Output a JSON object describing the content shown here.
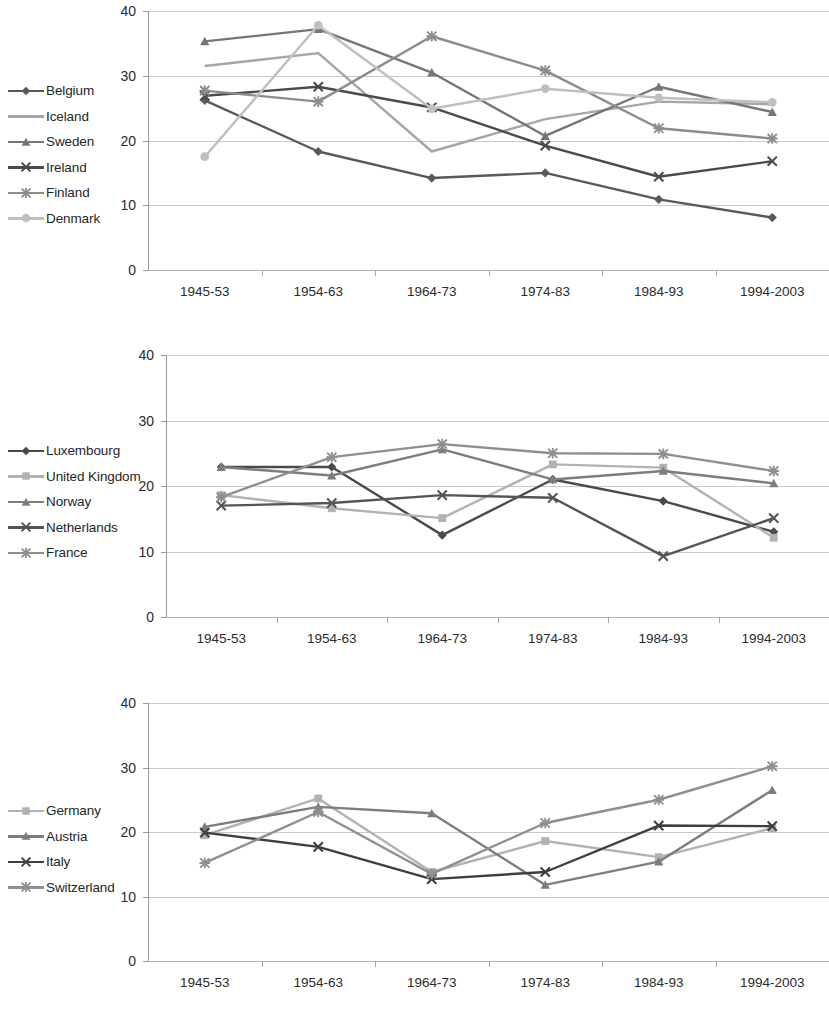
{
  "figure": {
    "categories": [
      "1945-53",
      "1954-63",
      "1964-73",
      "1974-83",
      "1984-93",
      "1994-2003"
    ],
    "y_ticks": [
      "0",
      "10",
      "20",
      "30",
      "40"
    ],
    "ylim": [
      0,
      40
    ]
  },
  "charts": [
    {
      "id": "chart-1",
      "legend_title": "",
      "series": [
        {
          "name": "Belgium",
          "marker": "diamond",
          "color": "#595959",
          "values": [
            26.2,
            18.3,
            14.2,
            15.0,
            10.9,
            8.1
          ]
        },
        {
          "name": "Iceland",
          "marker": "none",
          "color": "#a6a6a6",
          "values": [
            31.5,
            33.5,
            18.3,
            23.3,
            26.0,
            25.6
          ]
        },
        {
          "name": "Sweden",
          "marker": "triangle",
          "color": "#767676",
          "values": [
            35.3,
            37.2,
            30.5,
            20.7,
            28.3,
            24.4
          ]
        },
        {
          "name": "Ireland",
          "marker": "cross",
          "color": "#4a4a4a",
          "values": [
            26.9,
            28.3,
            25.1,
            19.2,
            14.4,
            16.8
          ]
        },
        {
          "name": "Finland",
          "marker": "asterisk",
          "color": "#8c8c8c",
          "values": [
            27.7,
            26.0,
            36.1,
            30.8,
            21.9,
            20.3
          ]
        },
        {
          "name": "Denmark",
          "marker": "circle",
          "color": "#bfbfbf",
          "values": [
            17.5,
            37.8,
            24.9,
            28.0,
            26.6,
            25.9
          ]
        }
      ]
    },
    {
      "id": "chart-2",
      "legend_title": "",
      "series": [
        {
          "name": "Luxembourg",
          "marker": "diamond",
          "color": "#4a4a4a",
          "values": [
            22.9,
            22.9,
            12.5,
            21.0,
            17.7,
            13.0
          ]
        },
        {
          "name": "United Kingdom",
          "marker": "square",
          "color": "#b2b2b2",
          "values": [
            18.6,
            16.6,
            15.1,
            23.3,
            22.8,
            12.1
          ]
        },
        {
          "name": "Norway",
          "marker": "triangle",
          "color": "#7d7d7d",
          "values": [
            22.9,
            21.6,
            25.6,
            21.0,
            22.3,
            20.4
          ]
        },
        {
          "name": "Netherlands",
          "marker": "cross",
          "color": "#555555",
          "values": [
            17.0,
            17.4,
            18.6,
            18.2,
            9.3,
            15.1
          ]
        },
        {
          "name": "France",
          "marker": "asterisk",
          "color": "#8f8f8f",
          "values": [
            18.3,
            24.4,
            26.4,
            25.0,
            24.9,
            22.3
          ]
        }
      ]
    },
    {
      "id": "chart-3",
      "legend_title": "",
      "series": [
        {
          "name": "Germany",
          "marker": "square",
          "color": "#b2b2b2",
          "values": [
            19.5,
            25.2,
            13.8,
            18.6,
            16.1,
            20.6
          ]
        },
        {
          "name": "Austria",
          "marker": "triangle",
          "color": "#7d7d7d",
          "values": [
            20.8,
            23.9,
            22.9,
            11.8,
            15.4,
            26.5
          ]
        },
        {
          "name": "Italy",
          "marker": "cross",
          "color": "#3f3f3f",
          "values": [
            19.9,
            17.7,
            12.7,
            13.8,
            21.0,
            20.9
          ]
        },
        {
          "name": "Switzerland",
          "marker": "asterisk",
          "color": "#8f8f8f",
          "values": [
            15.2,
            23.1,
            13.5,
            21.4,
            25.0,
            30.2
          ]
        }
      ]
    }
  ]
}
